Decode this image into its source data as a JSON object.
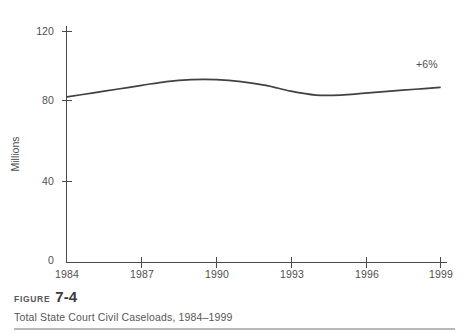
{
  "figure": {
    "label_word": "FIGURE",
    "number": "7-4",
    "caption": "Total State Court Civil Caseloads, 1984–1999"
  },
  "chart_data": {
    "type": "line",
    "title": "Total State Court Civil Caseloads, 1984–1999",
    "xlabel": "",
    "ylabel": "Millions",
    "xlim": [
      1984,
      1999
    ],
    "ylim": [
      0,
      120
    ],
    "grid": false,
    "legend": false,
    "x_ticks": [
      "1984",
      "1987",
      "1990",
      "1993",
      "1996",
      "1999"
    ],
    "y_ticks": [
      "0",
      "40",
      "80",
      "120"
    ],
    "series": [
      {
        "name": "Total State Court Civil Caseloads",
        "color": "#414042",
        "annotation": "+6%",
        "x": [
          1984,
          1985,
          1986,
          1987,
          1988,
          1989,
          1990,
          1991,
          1992,
          1993,
          1994,
          1995,
          1996,
          1997,
          1998,
          1999
        ],
        "values": [
          86,
          88,
          90,
          92,
          94,
          95,
          95,
          94,
          92,
          89,
          87,
          87,
          88,
          89,
          90,
          91
        ]
      }
    ]
  },
  "axis": {
    "y_title": "Millions",
    "y_tick_0": "0",
    "y_tick_40": "40",
    "y_tick_80": "80",
    "y_tick_120": "120",
    "x_tick_1984": "1984",
    "x_tick_1987": "1987",
    "x_tick_1990": "1990",
    "x_tick_1993": "1993",
    "x_tick_1996": "1996",
    "x_tick_1999": "1999"
  },
  "annotation": {
    "growth": "+6%"
  }
}
